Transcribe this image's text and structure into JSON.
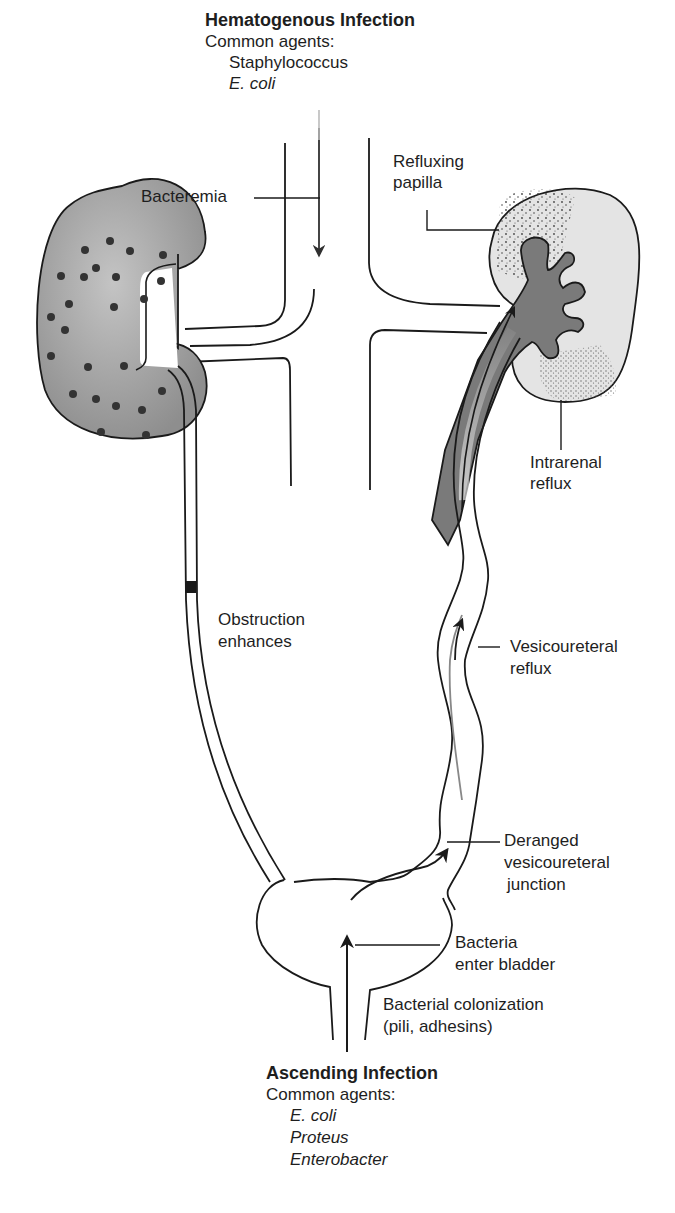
{
  "hematogenous": {
    "title": "Hematogenous Infection",
    "subtitle": "Common agents:",
    "agents": [
      "Staphylococcus",
      "E. coli"
    ]
  },
  "labels": {
    "bacteremia": "Bacteremia",
    "refluxing_papilla_1": "Refluxing",
    "refluxing_papilla_2": "papilla",
    "intrarenal_reflux_1": "Intrarenal",
    "intrarenal_reflux_2": "reflux",
    "obstruction_1": "Obstruction",
    "obstruction_2": "enhances",
    "vesicoureteral_reflux_1": "Vesicoureteral",
    "vesicoureteral_reflux_2": "reflux",
    "deranged_1": "Deranged",
    "deranged_2": "vesicoureteral",
    "deranged_3": "junction",
    "bacteria_enter_1": "Bacteria",
    "bacteria_enter_2": "enter bladder",
    "colonization_1": "Bacterial colonization",
    "colonization_2": "(pili, adhesins)"
  },
  "ascending": {
    "title": "Ascending Infection",
    "subtitle": "Common agents:",
    "agents": [
      "E. coli",
      "Proteus",
      "Enterobacter"
    ]
  },
  "colors": {
    "line": "#1a1a1a",
    "left_kidney_fill": "#a8a8a8",
    "right_kidney_fill": "#e6e6e6",
    "pelvis_fill": "#7c7c7c",
    "dot": "#3a3a3a"
  }
}
